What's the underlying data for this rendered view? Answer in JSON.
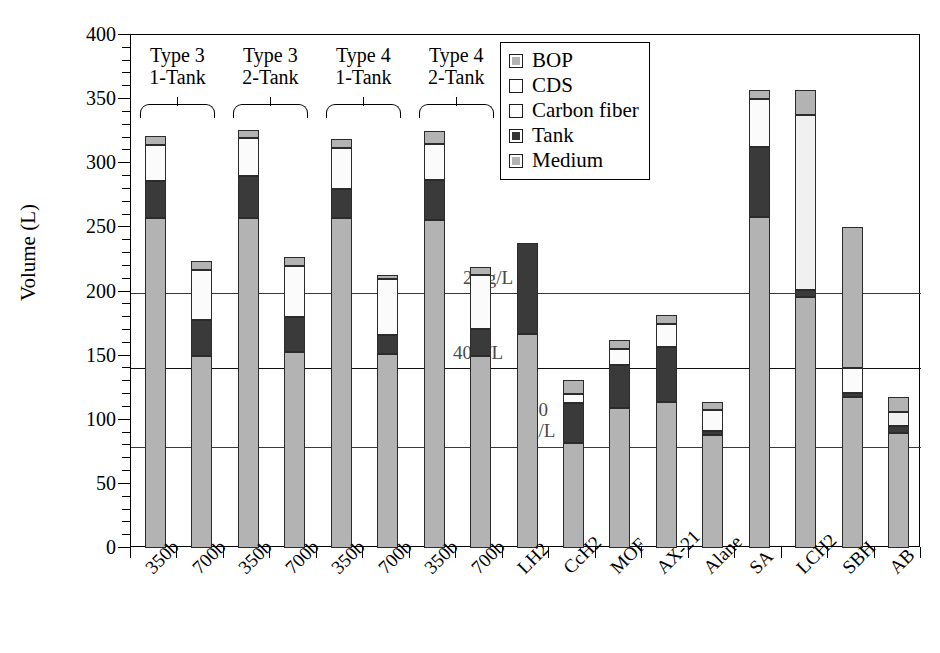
{
  "chart_data": {
    "type": "bar",
    "subtype": "stacked-bar",
    "title": "",
    "xlabel": "",
    "ylabel": "Volume (L)",
    "ylim": [
      0,
      400
    ],
    "ytick_step": 50,
    "yticks": [
      0,
      50,
      100,
      150,
      200,
      250,
      300,
      350,
      400
    ],
    "ytick_labels": [
      "0",
      "50",
      "100",
      "150",
      "200",
      "250",
      "300",
      "350",
      "400"
    ],
    "yminor_step": 10,
    "grid": "horizontal-reference-lines-only",
    "legend_position": "top-right-inside",
    "categories": [
      "350b",
      "700b",
      "350b",
      "700b",
      "350b",
      "700b",
      "350b",
      "700b",
      "LH2",
      "CcH2",
      "MOF",
      "AX-21",
      "Alane",
      "SA",
      "LCH2",
      "SBH",
      "AB"
    ],
    "stack_order": [
      "Medium",
      "Tank",
      "Carbon fiber",
      "CDS",
      "BOP"
    ],
    "series": [
      {
        "name": "Medium",
        "values": [
          257,
          150,
          257,
          153,
          257,
          151,
          256,
          150,
          167,
          82,
          109,
          114,
          88,
          258,
          196,
          118,
          90
        ]
      },
      {
        "name": "Tank",
        "values": [
          29,
          28,
          33,
          27,
          23,
          15,
          31,
          21,
          71,
          31,
          34,
          43,
          3,
          55,
          5,
          3,
          5
        ]
      },
      {
        "name": "Carbon fiber",
        "values": [
          28,
          39,
          30,
          40,
          32,
          44,
          28,
          42,
          0,
          7,
          12,
          18,
          17,
          37,
          0,
          19,
          0
        ]
      },
      {
        "name": "CDS",
        "values": [
          0,
          0,
          0,
          0,
          0,
          0,
          0,
          0,
          0,
          0,
          0,
          0,
          0,
          0,
          137,
          0,
          11
        ]
      },
      {
        "name": "BOP",
        "values": [
          7,
          7,
          6,
          7,
          7,
          3,
          10,
          6,
          0,
          11,
          7,
          7,
          6,
          7,
          19,
          110,
          12
        ]
      }
    ],
    "totals": [
      321,
      224,
      326,
      227,
      319,
      213,
      325,
      219,
      238,
      131,
      162,
      182,
      114,
      357,
      357,
      250,
      118
    ],
    "reference_lines": [
      {
        "label": "28 g/L",
        "value": 199
      },
      {
        "label": "40 g/L",
        "value": 140
      },
      {
        "label": "70 g/L",
        "value": 79,
        "label_line2": "g/L"
      }
    ],
    "legend_entries": [
      {
        "label": "BOP",
        "color": "#b3b3b3"
      },
      {
        "label": "CDS",
        "color": "#ffffff"
      },
      {
        "label": "Carbon fiber",
        "color": "#ffffff"
      },
      {
        "label": "Tank",
        "color": "#333333"
      },
      {
        "label": "Medium",
        "color": "#b3b3b3"
      }
    ],
    "group_annotations": [
      {
        "line1": "Type 3",
        "line2": "1-Tank",
        "from": 0,
        "to": 1
      },
      {
        "line1": "Type 3",
        "line2": "2-Tank",
        "from": 2,
        "to": 3
      },
      {
        "line1": "Type 4",
        "line2": "1-Tank",
        "from": 4,
        "to": 5
      },
      {
        "line1": "Type 4",
        "line2": "2-Tank",
        "from": 6,
        "to": 7
      }
    ]
  },
  "axis": {
    "y_title": "Volume (L)"
  }
}
